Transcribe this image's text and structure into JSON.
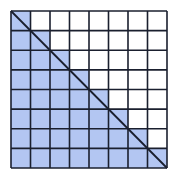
{
  "diagram": {
    "type": "grid-staircase",
    "rows": 8,
    "cols": 8,
    "shading_rule": "row i (0-indexed from top) shades columns 0..i",
    "diagonal": "top-left to bottom-right",
    "colors": {
      "shade": "#b3c6f2",
      "grid_line": "#1a1f2e",
      "background": "#ffffff"
    },
    "geometry": {
      "x0": 11,
      "y0": 11,
      "width": 156,
      "height": 157
    }
  }
}
